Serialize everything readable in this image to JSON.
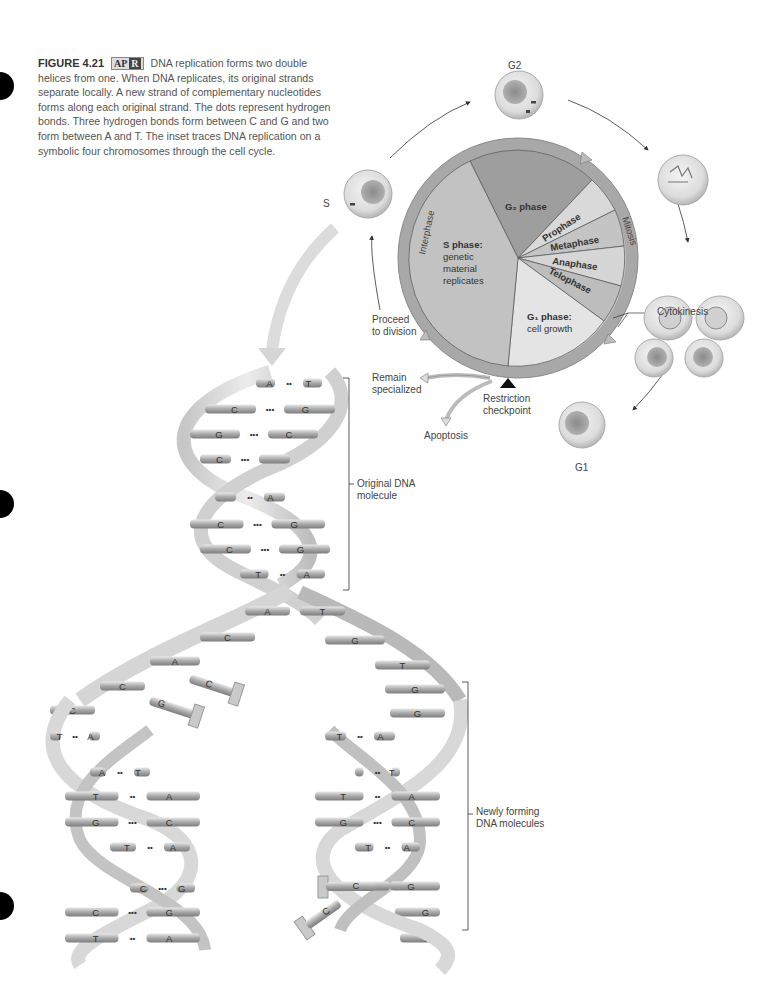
{
  "caption": {
    "figure_number": "FIGURE 4.21",
    "badge_left": "AP",
    "badge_right": "R",
    "text": "DNA replication forms two double helices from one. When DNA replicates, its original strands separate locally. A new strand of complementary nucleotides forms along each original strand. The dots represent hydrogen bonds. Three hydrogen bonds form between C and G and two form between A and T. The inset traces DNA replication on a symbolic four chromosomes through the cell cycle."
  },
  "cell_cycle": {
    "stage_labels": {
      "g2": "G2",
      "s": "S",
      "g1": "G1"
    },
    "ring_labels": {
      "interphase": "Interphase",
      "mitosis": "Mitosis"
    },
    "segments": {
      "g2_phase": "G₂ phase",
      "s_phase_title": "S phase:",
      "s_phase_desc_1": "genetic",
      "s_phase_desc_2": "material",
      "s_phase_desc_3": "replicates",
      "prophase": "Prophase",
      "metaphase": "Metaphase",
      "anaphase": "Anaphase",
      "telophase": "Telophase",
      "g1_phase_title": "G₁ phase:",
      "g1_phase_desc": "cell growth"
    },
    "annotations": {
      "cytokinesis": "Cytokinesis",
      "proceed_1": "Proceed",
      "proceed_2": "to division",
      "remain_1": "Remain",
      "remain_2": "specialized",
      "restriction_1": "Restriction",
      "restriction_2": "checkpoint",
      "apoptosis": "Apoptosis"
    }
  },
  "dna": {
    "original_label_1": "Original DNA",
    "original_label_2": "molecule",
    "new_label_1": "Newly forming",
    "new_label_2": "DNA molecules",
    "original_pairs": [
      {
        "l": "A",
        "r": "T",
        "bonds": "••"
      },
      {
        "l": "C",
        "r": "G",
        "bonds": "•••"
      },
      {
        "l": "G",
        "r": "C",
        "bonds": "•••"
      },
      {
        "l": "C",
        "r": "",
        "bonds": "•••"
      },
      {
        "l": "",
        "r": "A",
        "bonds": "••"
      },
      {
        "l": "C",
        "r": "G",
        "bonds": "•••"
      },
      {
        "l": "C",
        "r": "G",
        "bonds": "•••"
      },
      {
        "l": "T",
        "r": "A",
        "bonds": "••"
      }
    ],
    "fork_bases": [
      "A",
      "T",
      "C",
      "G",
      "A",
      "T",
      "C",
      "G",
      "C",
      "G"
    ],
    "left_new_pairs": [
      {
        "l": "T",
        "r": "A",
        "bonds": "••"
      },
      {
        "l": "A",
        "r": "T",
        "bonds": "••"
      },
      {
        "l": "T",
        "r": "A",
        "bonds": "••"
      },
      {
        "l": "G",
        "r": "C",
        "bonds": "•••"
      },
      {
        "l": "T",
        "r": "A",
        "bonds": "••"
      },
      {
        "l": "C",
        "r": "G",
        "bonds": "•••"
      },
      {
        "l": "C",
        "r": "G",
        "bonds": "•••"
      },
      {
        "l": "T",
        "r": "A",
        "bonds": "••"
      }
    ],
    "right_new_pairs": [
      {
        "l": "T",
        "r": "A",
        "bonds": "••"
      },
      {
        "l": "",
        "r": "T",
        "bonds": "••"
      },
      {
        "l": "T",
        "r": "A",
        "bonds": "••"
      },
      {
        "l": "G",
        "r": "C",
        "bonds": "•••"
      },
      {
        "l": "T",
        "r": "A",
        "bonds": "••"
      },
      {
        "l": "C",
        "r": "G",
        "bonds": ""
      }
    ],
    "free_nucleotides": [
      "C",
      "G",
      "C",
      "C"
    ],
    "right_tail_bases": [
      "G",
      "A"
    ]
  }
}
